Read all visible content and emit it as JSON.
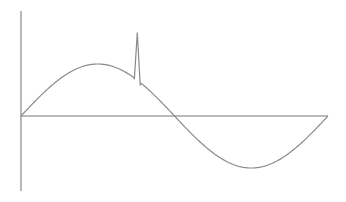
{
  "chart_data": {
    "type": "line",
    "title": "",
    "xlabel": "",
    "ylabel": "",
    "grid": false,
    "legend": null,
    "x_range": [
      0,
      6.283
    ],
    "y_range": [
      -1.2,
      2.1
    ],
    "series": [
      {
        "name": "signal",
        "color": "#8a8a8a",
        "points": [
          [
            0.0,
            0.0
          ],
          [
            0.5,
            0.48
          ],
          [
            1.0,
            0.84
          ],
          [
            1.57,
            1.0
          ],
          [
            2.0,
            0.91
          ],
          [
            2.3,
            0.72
          ],
          [
            2.38,
            1.6
          ],
          [
            2.45,
            0.66
          ],
          [
            2.6,
            0.52
          ],
          [
            3.14,
            0.0
          ],
          [
            3.6,
            -0.44
          ],
          [
            4.0,
            -0.76
          ],
          [
            4.71,
            -1.0
          ],
          [
            5.2,
            -0.88
          ],
          [
            5.7,
            -0.55
          ],
          [
            6.283,
            0.0
          ]
        ]
      }
    ],
    "annotations": [
      {
        "type": "spike",
        "x": 2.38,
        "y": 1.6
      }
    ],
    "axes": {
      "x_axis_color": "#888888",
      "y_axis_color": "#888888",
      "ticks": []
    }
  },
  "layout": {
    "origin_px": [
      21,
      116
    ],
    "y_axis_px": {
      "x": 21,
      "top": 11,
      "bottom": 191
    },
    "x_axis_px": {
      "y": 116,
      "left": 21,
      "right": 328
    },
    "amplitude_px": 52
  }
}
